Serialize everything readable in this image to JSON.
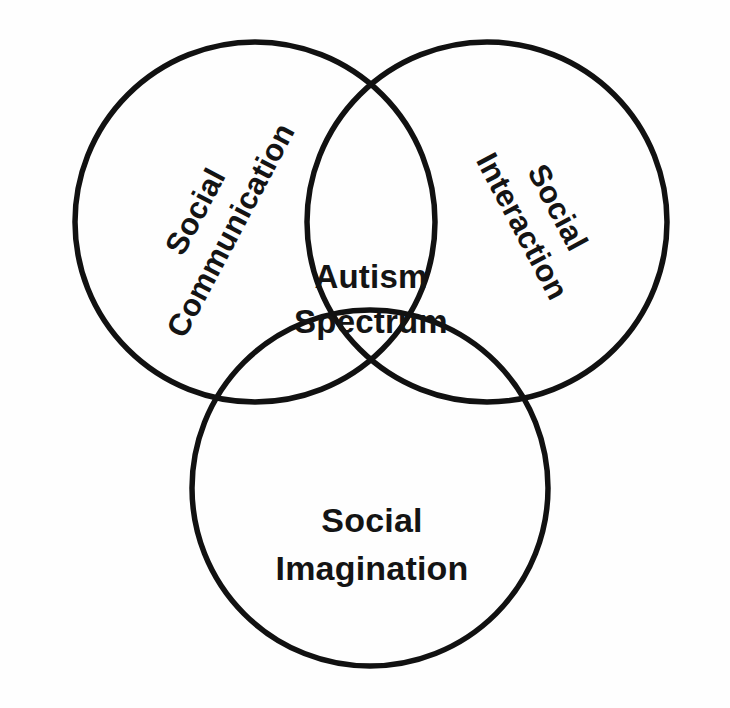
{
  "diagram": {
    "type": "venn",
    "background_color": "#fefefe",
    "stroke_color": "#111111",
    "text_color": "#141414",
    "sets": [
      {
        "id": "social-communication",
        "label_line1": "Social",
        "label_line2": "Communication",
        "full_label": "Social Communication",
        "position": "top-left",
        "rotation_deg": -62,
        "center_x": 255,
        "center_y": 222,
        "radius": 180
      },
      {
        "id": "social-interaction",
        "label_line1": "Social",
        "label_line2": "Interaction",
        "full_label": "Social Interaction",
        "position": "top-right",
        "rotation_deg": 62,
        "center_x": 487,
        "center_y": 222,
        "radius": 180
      },
      {
        "id": "social-imagination",
        "label_line1": "Social",
        "label_line2": "Imagination",
        "full_label": "Social Imagination",
        "position": "bottom",
        "rotation_deg": 0,
        "center_x": 370,
        "center_y": 488,
        "radius": 178
      }
    ],
    "intersection": {
      "id": "autism-spectrum",
      "label_line1": "Autism",
      "label_line2": "Spectrum",
      "full_label": "Autism Spectrum",
      "center_x": 371,
      "center_y": 300
    }
  }
}
